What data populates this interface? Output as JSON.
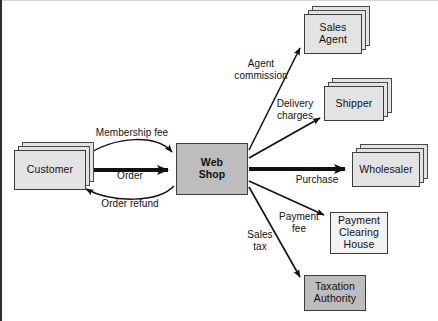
{
  "diagram": {
    "type": "value-network-diagram",
    "colors": {
      "box_light": "#e3e3e3",
      "box_dark": "#bdbdbd",
      "box_plain": "#f2f2f2",
      "stroke": "#3d3d3d",
      "arrow": "#111111",
      "background": "#ffffff"
    },
    "nodes": [
      {
        "id": "customer",
        "label": "Customer",
        "style": "stacked-light",
        "x": 14,
        "y": 150,
        "w": 72,
        "h": 40
      },
      {
        "id": "web-shop",
        "label": "Web\nShop",
        "style": "single-dark",
        "x": 176,
        "y": 143,
        "w": 72,
        "h": 52
      },
      {
        "id": "sales-agent",
        "label": "Sales\nAgent",
        "style": "stacked-light",
        "x": 304,
        "y": 14,
        "w": 58,
        "h": 40
      },
      {
        "id": "shipper",
        "label": "Shipper",
        "style": "stacked-light",
        "x": 324,
        "y": 86,
        "w": 60,
        "h": 35
      },
      {
        "id": "wholesaler",
        "label": "Wholesaler",
        "style": "stacked-light",
        "x": 352,
        "y": 152,
        "w": 68,
        "h": 35
      },
      {
        "id": "payment-clearing-house",
        "label": "Payment\nClearing\nHouse",
        "style": "single-plain",
        "x": 330,
        "y": 212,
        "w": 58,
        "h": 42
      },
      {
        "id": "taxation-authority",
        "label": "Taxation\nAuthority",
        "style": "single-dark",
        "x": 304,
        "y": 275,
        "w": 62,
        "h": 36
      }
    ],
    "flows": [
      {
        "id": "membership-fee",
        "label": "Membership fee",
        "from": "customer",
        "to": "web-shop",
        "shape": "curve-top",
        "label_x": 84,
        "label_y": 127,
        "label_w": 96,
        "label_align": "center"
      },
      {
        "id": "order",
        "label": "Order",
        "from": "customer",
        "to": "web-shop",
        "shape": "straight-thick",
        "label_x": 100,
        "label_y": 170,
        "label_w": 60,
        "label_align": "center"
      },
      {
        "id": "order-refund",
        "label": "Order refund",
        "from": "web-shop",
        "to": "customer",
        "shape": "curve-bottom",
        "label_x": 84,
        "label_y": 198,
        "label_w": 92,
        "label_align": "center"
      },
      {
        "id": "agent-commission",
        "label": "Agent\ncommission",
        "from": "web-shop",
        "to": "sales-agent",
        "shape": "straight",
        "label_x": 225,
        "label_y": 58,
        "label_w": 72,
        "label_align": "center"
      },
      {
        "id": "delivery-charges",
        "label": "Delivery\ncharges",
        "from": "web-shop",
        "to": "shipper",
        "shape": "straight",
        "label_x": 268,
        "label_y": 98,
        "label_w": 54,
        "label_align": "center"
      },
      {
        "id": "purchase",
        "label": "Purchase",
        "from": "web-shop",
        "to": "wholesaler",
        "shape": "straight-thick",
        "label_x": 288,
        "label_y": 174,
        "label_w": 58,
        "label_align": "center"
      },
      {
        "id": "payment-fee",
        "label": "Payment\nfee",
        "from": "web-shop",
        "to": "payment-clearing-house",
        "shape": "straight",
        "label_x": 272,
        "label_y": 211,
        "label_w": 54,
        "label_align": "center"
      },
      {
        "id": "sales-tax",
        "label": "Sales\ntax",
        "from": "web-shop",
        "to": "taxation-authority",
        "shape": "straight",
        "label_x": 240,
        "label_y": 229,
        "label_w": 40,
        "label_align": "center"
      }
    ]
  }
}
